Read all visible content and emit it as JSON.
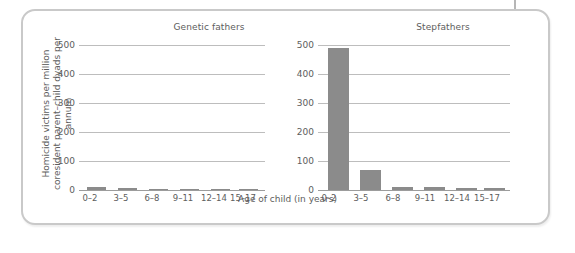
{
  "figure": {
    "y_axis_title": "Homicide victims per million coresident parent–child dyads per annum",
    "x_axis_title": "Age of child (in years)",
    "panel_left_title": "Genetic fathers",
    "panel_right_title": "Stepfathers",
    "bar_color": "#8b8b8b",
    "grid_color": "#bdbdbd",
    "text_color": "#5d5d5d",
    "frame_color": "#c9c9c9"
  },
  "chart_data": {
    "type": "bar",
    "title": "",
    "xlabel": "Age of child (in years)",
    "ylabel": "Homicide victims per million coresident parent–child dyads per annum",
    "ylim": [
      0,
      500
    ],
    "yticks": [
      0,
      100,
      200,
      300,
      400,
      500
    ],
    "ytick_labels": [
      "0",
      "100",
      "200",
      "300",
      "400",
      "500"
    ],
    "categories": [
      "0–2",
      "3–5",
      "6–8",
      "9–11",
      "12–14",
      "15–17"
    ],
    "grid": true,
    "legend": "none",
    "panels": [
      {
        "name": "Genetic fathers",
        "values": [
          10,
          6,
          3,
          4,
          3,
          3
        ]
      },
      {
        "name": "Stepfathers",
        "values": [
          491,
          68,
          9,
          11,
          8,
          8
        ]
      }
    ]
  }
}
